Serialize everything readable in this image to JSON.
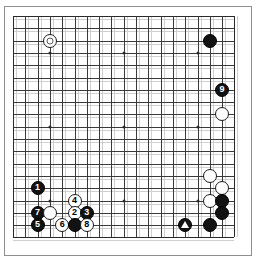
{
  "diagram": {
    "board_size": 19,
    "geometry": {
      "origin_x": 13,
      "origin_y": 16,
      "spacing": 12.3,
      "stone_radius": 7
    },
    "colors": {
      "background": "#ffffff",
      "grid_line": "#3a3a3a",
      "grid_line_faint": "#cfcfcf",
      "black_stone": "#121212",
      "white_stone": "#fefefe",
      "stone_outline": "#1a1a1a",
      "black_label_text": "#ffffff",
      "white_label_text": "#000000",
      "marker_circle": "#5a5a5a",
      "marker_triangle": "#ffffff",
      "hoshi": "#2a2a2a"
    },
    "hoshi_points": [
      {
        "col": 4,
        "row": 4
      },
      {
        "col": 10,
        "row": 4
      },
      {
        "col": 16,
        "row": 4
      },
      {
        "col": 4,
        "row": 10
      },
      {
        "col": 10,
        "row": 10
      },
      {
        "col": 16,
        "row": 10
      },
      {
        "col": 4,
        "row": 16
      },
      {
        "col": 10,
        "row": 16
      },
      {
        "col": 16,
        "row": 16
      }
    ],
    "stones": [
      {
        "id": "w-circle-marked-upper-left",
        "color": "white",
        "col": 4,
        "row": 3,
        "label": "",
        "marker": "circle"
      },
      {
        "id": "b-upper-right",
        "color": "black",
        "col": 17,
        "row": 3,
        "label": "",
        "marker": ""
      },
      {
        "id": "b-move-9",
        "color": "black",
        "col": 18,
        "row": 7,
        "label": "9",
        "marker": ""
      },
      {
        "id": "w-right-side-upper",
        "color": "white",
        "col": 18,
        "row": 9,
        "label": "",
        "marker": ""
      },
      {
        "id": "w-right-side-a",
        "color": "white",
        "col": 17,
        "row": 14,
        "label": "",
        "marker": ""
      },
      {
        "id": "w-right-side-b",
        "color": "white",
        "col": 18,
        "row": 15,
        "label": "",
        "marker": ""
      },
      {
        "id": "w-right-side-c",
        "color": "white",
        "col": 17,
        "row": 16,
        "label": "",
        "marker": ""
      },
      {
        "id": "b-right-side-a",
        "color": "black",
        "col": 18,
        "row": 16,
        "label": "",
        "marker": ""
      },
      {
        "id": "b-right-side-b",
        "color": "black",
        "col": 18,
        "row": 17,
        "label": "",
        "marker": ""
      },
      {
        "id": "b-bottom-right",
        "color": "black",
        "col": 17,
        "row": 18,
        "label": "",
        "marker": ""
      },
      {
        "id": "b-triangle-marked-bottom",
        "color": "black",
        "col": 15,
        "row": 18,
        "label": "",
        "marker": "triangle"
      },
      {
        "id": "b-move-1",
        "color": "black",
        "col": 3,
        "row": 15,
        "label": "1",
        "marker": ""
      },
      {
        "id": "w-move-4",
        "color": "white",
        "col": 6,
        "row": 16,
        "label": "4",
        "marker": ""
      },
      {
        "id": "b-move-7",
        "color": "black",
        "col": 3,
        "row": 17,
        "label": "7",
        "marker": ""
      },
      {
        "id": "w-unnumbered-left",
        "color": "white",
        "col": 4,
        "row": 17,
        "label": "",
        "marker": ""
      },
      {
        "id": "w-move-2",
        "color": "white",
        "col": 6,
        "row": 17,
        "label": "2",
        "marker": ""
      },
      {
        "id": "b-move-3",
        "color": "black",
        "col": 7,
        "row": 17,
        "label": "3",
        "marker": ""
      },
      {
        "id": "b-move-5",
        "color": "black",
        "col": 3,
        "row": 18,
        "label": "5",
        "marker": ""
      },
      {
        "id": "w-move-6",
        "color": "white",
        "col": 5,
        "row": 18,
        "label": "6",
        "marker": ""
      },
      {
        "id": "b-unnumbered-bottom",
        "color": "black",
        "col": 6,
        "row": 18,
        "label": "",
        "marker": ""
      },
      {
        "id": "w-move-8",
        "color": "white",
        "col": 7,
        "row": 18,
        "label": "8",
        "marker": ""
      }
    ],
    "move_sequence": [
      "1",
      "2",
      "3",
      "4",
      "5",
      "6",
      "7",
      "8",
      "9"
    ]
  }
}
